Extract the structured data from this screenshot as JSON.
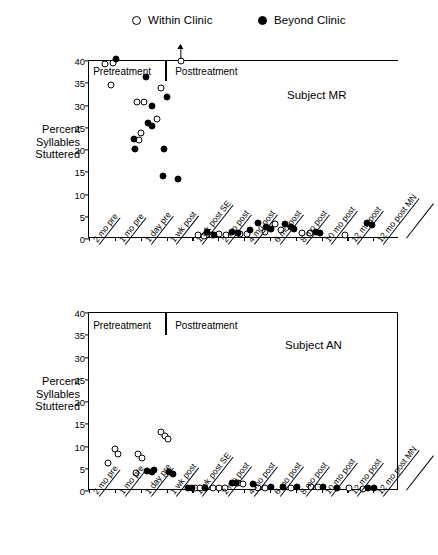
{
  "legend": {
    "items": [
      {
        "label": "Within Clinic",
        "marker": "open-circle-icon"
      },
      {
        "label": "Beyond Clinic",
        "marker": "filled-circle-icon"
      }
    ]
  },
  "axis": {
    "ylabel_lines": [
      "Percent",
      "Syllables",
      "Stuttered"
    ],
    "yticks": [
      0,
      5,
      10,
      15,
      20,
      25,
      30,
      35,
      40
    ],
    "ylim": [
      0,
      40
    ],
    "categories": [
      "2 mo pre",
      "1 mo pre",
      "1 day pre",
      "1 wk post",
      "1 wk post SE",
      "2 mo post",
      "4 mo post",
      "6 mo post",
      "8 mo post",
      "10 mo post",
      "12 mo post",
      "12 mo post MN"
    ],
    "phase_labels": {
      "pre": "Pretreatment",
      "post": "Posttreatment"
    }
  },
  "chart_data": [
    {
      "type": "scatter",
      "title": "Subject MR",
      "xlabel": "",
      "ylabel": "Percent Syllables Stuttered",
      "ylim": [
        0,
        40
      ],
      "yticks": [
        0,
        5,
        10,
        15,
        20,
        25,
        30,
        35,
        40
      ],
      "grid": false,
      "legend_position": "above-figure",
      "categories": [
        "2 mo pre",
        "1 mo pre",
        "1 day pre",
        "1 wk post",
        "1 wk post SE",
        "2 mo post",
        "4 mo post",
        "6 mo post",
        "8 mo post",
        "10 mo post",
        "12 mo post",
        "12 mo post MN"
      ],
      "treatment_divider_after_category": "1 day pre",
      "annotations": [
        {
          "text": "off-scale point above 40",
          "x": 3.05,
          "y": 40,
          "marker": "open",
          "arrow": "up"
        }
      ],
      "series": [
        {
          "name": "Within Clinic",
          "marker": "open",
          "points": [
            {
              "x": 0.1,
              "y": 39.3
            },
            {
              "x": 0.42,
              "y": 39.6
            },
            {
              "x": 0.35,
              "y": 34.6
            },
            {
              "x": 1.35,
              "y": 30.8
            },
            {
              "x": 1.62,
              "y": 30.7
            },
            {
              "x": 1.5,
              "y": 23.9
            },
            {
              "x": 1.42,
              "y": 22.2
            },
            {
              "x": 2.3,
              "y": 33.9
            },
            {
              "x": 2.12,
              "y": 26.9
            },
            {
              "x": 3.05,
              "y": 40.0
            },
            {
              "x": 3.7,
              "y": 0.9
            },
            {
              "x": 3.95,
              "y": 0.7
            },
            {
              "x": 4.25,
              "y": 0.9
            },
            {
              "x": 4.55,
              "y": 1.1
            },
            {
              "x": 4.8,
              "y": 1.0
            },
            {
              "x": 5.35,
              "y": 1.2
            },
            {
              "x": 5.6,
              "y": 1.1
            },
            {
              "x": 6.3,
              "y": 1.5
            },
            {
              "x": 6.7,
              "y": 3.4
            },
            {
              "x": 6.95,
              "y": 2.1
            },
            {
              "x": 7.75,
              "y": 1.3
            },
            {
              "x": 8.05,
              "y": 1.4
            },
            {
              "x": 9.4,
              "y": 0.9
            }
          ]
        },
        {
          "name": "Beyond Clinic",
          "marker": "filled",
          "points": [
            {
              "x": 0.55,
              "y": 40.5
            },
            {
              "x": 1.72,
              "y": 36.5
            },
            {
              "x": 1.95,
              "y": 29.9
            },
            {
              "x": 1.8,
              "y": 26.1
            },
            {
              "x": 1.95,
              "y": 25.4
            },
            {
              "x": 1.25,
              "y": 22.5
            },
            {
              "x": 1.28,
              "y": 20.2
            },
            {
              "x": 2.52,
              "y": 31.9
            },
            {
              "x": 2.4,
              "y": 20.3
            },
            {
              "x": 2.35,
              "y": 14.2
            },
            {
              "x": 2.95,
              "y": 13.4
            },
            {
              "x": 4.05,
              "y": 1.5
            },
            {
              "x": 4.35,
              "y": 0.8
            },
            {
              "x": 5.05,
              "y": 1.6
            },
            {
              "x": 5.25,
              "y": 1.4
            },
            {
              "x": 5.75,
              "y": 2.0
            },
            {
              "x": 6.05,
              "y": 3.7
            },
            {
              "x": 6.35,
              "y": 2.6
            },
            {
              "x": 6.55,
              "y": 2.3
            },
            {
              "x": 7.1,
              "y": 3.3
            },
            {
              "x": 7.3,
              "y": 2.8
            },
            {
              "x": 7.45,
              "y": 2.2
            },
            {
              "x": 8.3,
              "y": 1.6
            },
            {
              "x": 8.45,
              "y": 1.4
            },
            {
              "x": 10.25,
              "y": 3.6
            },
            {
              "x": 10.45,
              "y": 3.2
            }
          ]
        }
      ]
    },
    {
      "type": "scatter",
      "title": "Subject AN",
      "xlabel": "",
      "ylabel": "Percent Syllables Stuttered",
      "ylim": [
        0,
        40
      ],
      "yticks": [
        0,
        5,
        10,
        15,
        20,
        25,
        30,
        35,
        40
      ],
      "grid": false,
      "legend_position": "above-figure",
      "categories": [
        "2 mo pre",
        "1 mo pre",
        "1 day pre",
        "1 wk post",
        "1 wk post SE",
        "2 mo post",
        "4 mo post",
        "6 mo post",
        "8 mo post",
        "10 mo post",
        "12 mo post",
        "12 mo post MN"
      ],
      "treatment_divider_after_category": "1 day pre",
      "annotations": [],
      "series": [
        {
          "name": "Within Clinic",
          "marker": "open",
          "points": [
            {
              "x": 0.22,
              "y": 6.4
            },
            {
              "x": 0.52,
              "y": 9.4
            },
            {
              "x": 0.62,
              "y": 8.3
            },
            {
              "x": 1.38,
              "y": 8.4
            },
            {
              "x": 1.55,
              "y": 7.4
            },
            {
              "x": 1.3,
              "y": 4.1
            },
            {
              "x": 2.3,
              "y": 13.2
            },
            {
              "x": 2.45,
              "y": 12.4
            },
            {
              "x": 2.55,
              "y": 11.6
            },
            {
              "x": 3.6,
              "y": 0.6
            },
            {
              "x": 3.8,
              "y": 0.6
            },
            {
              "x": 4.3,
              "y": 0.7
            },
            {
              "x": 4.55,
              "y": 0.6
            },
            {
              "x": 4.75,
              "y": 0.7
            },
            {
              "x": 5.25,
              "y": 1.8
            },
            {
              "x": 5.45,
              "y": 1.6
            },
            {
              "x": 6.05,
              "y": 0.6
            },
            {
              "x": 6.3,
              "y": 0.6
            },
            {
              "x": 7.3,
              "y": 0.7
            },
            {
              "x": 8.1,
              "y": 1.0
            },
            {
              "x": 8.35,
              "y": 0.9
            },
            {
              "x": 9.55,
              "y": 0.6
            },
            {
              "x": 10.1,
              "y": 0.5
            }
          ]
        },
        {
          "name": "Beyond Clinic",
          "marker": "filled",
          "points": [
            {
              "x": 1.75,
              "y": 4.6
            },
            {
              "x": 1.92,
              "y": 4.2
            },
            {
              "x": 2.02,
              "y": 4.7
            },
            {
              "x": 2.6,
              "y": 4.3
            },
            {
              "x": 2.75,
              "y": 3.8
            },
            {
              "x": 3.35,
              "y": 0.6
            },
            {
              "x": 3.5,
              "y": 0.7
            },
            {
              "x": 4.0,
              "y": 0.6
            },
            {
              "x": 5.05,
              "y": 1.9
            },
            {
              "x": 5.2,
              "y": 1.8
            },
            {
              "x": 5.85,
              "y": 1.6
            },
            {
              "x": 6.55,
              "y": 0.8
            },
            {
              "x": 7.0,
              "y": 0.9
            },
            {
              "x": 7.55,
              "y": 0.8
            },
            {
              "x": 8.55,
              "y": 0.8
            },
            {
              "x": 9.1,
              "y": 0.7
            },
            {
              "x": 10.3,
              "y": 0.6
            },
            {
              "x": 10.55,
              "y": 0.6
            }
          ]
        }
      ]
    }
  ]
}
